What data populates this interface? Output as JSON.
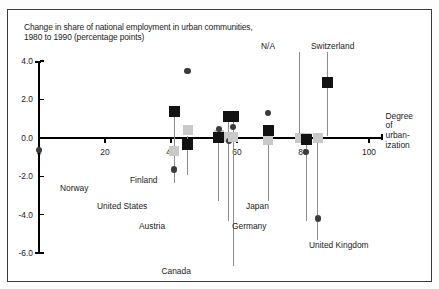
{
  "chart_data": {
    "type": "scatter",
    "title": "Change in share of national employment in urban communities, 1980 to 1990 (percentage points)",
    "title_line1": "Change in share of national employment in urban communities,",
    "title_line2": "1980 to 1990 (percentage points)",
    "xlabel": "Degree of urbanization",
    "xlabel_lines": [
      "Degree",
      "of",
      "urban-",
      "ization"
    ],
    "ylabel": "",
    "xlim": [
      0,
      100
    ],
    "ylim": [
      -6.0,
      4.0
    ],
    "xticks": [
      "0",
      "20",
      "40",
      "60",
      "80",
      "100"
    ],
    "xtick_values": [
      0,
      20,
      40,
      60,
      80,
      100
    ],
    "yticks": [
      "4.0",
      "2.0",
      "0.0",
      "-2.0",
      "-4.0",
      "-6.0"
    ],
    "ytick_values": [
      4.0,
      2.0,
      0.0,
      -2.0,
      -4.0,
      -6.0
    ],
    "grid": false,
    "legend": false,
    "na_note": "N/A",
    "series": [
      {
        "name": "urban (dark square)",
        "color": "#121212",
        "marker": "square"
      },
      {
        "name": "intermediate (light square)",
        "color": "#c9c9c9",
        "marker": "square"
      },
      {
        "name": "rural (dark circle)",
        "color": "#3b3b3b",
        "marker": "circle"
      }
    ],
    "points": [
      {
        "country": "Norway",
        "x": 41.0,
        "dark_square": 1.35,
        "light_square": -0.7,
        "circle": -1.65
      },
      {
        "country": "Finland",
        "x": 45.0,
        "dark_square": -0.35,
        "light_square": 0.4,
        "circle": 3.5
      },
      {
        "country": "United States",
        "x": 54.5,
        "dark_square": 0.0,
        "light_square": 0.15,
        "circle": 0.45
      },
      {
        "country": "Austria",
        "x": 57.5,
        "dark_square": 1.1,
        "light_square": 0.05,
        "circle": -0.15
      },
      {
        "country": "Canada",
        "x": 58.8,
        "dark_square": 1.1,
        "light_square": 0.05,
        "circle": 0.55
      },
      {
        "country": "Japan",
        "x": 69.5,
        "dark_square": 0.4,
        "light_square": -0.1,
        "circle": 1.3
      },
      {
        "country": "N/A",
        "x": 79.0,
        "dark_square": null,
        "light_square": 0.0,
        "circle": null
      },
      {
        "country": "Germany",
        "x": 81.0,
        "dark_square": -0.1,
        "light_square": 0.0,
        "circle": -0.75
      },
      {
        "country": "United Kingdom",
        "x": 84.5,
        "dark_square": null,
        "light_square": 0.0,
        "circle": -4.2
      },
      {
        "country": "Switzerland",
        "x": 87.5,
        "dark_square": 2.9,
        "light_square": null,
        "circle": null
      }
    ]
  },
  "labels": {
    "norway": "Norway",
    "finland": "Finland",
    "united_states": "United States",
    "austria": "Austria",
    "canada": "Canada",
    "japan": "Japan",
    "germany": "Germany",
    "united_kingdom": "United Kingdom",
    "switzerland": "Switzerland",
    "na": "N/A"
  },
  "colors": {
    "dark_marker": "#121212",
    "light_marker": "#c9c9c9",
    "circle_marker": "#3b3b3b",
    "axis": "#000000",
    "frame": "#3a3a3a",
    "text": "#1a1a1a"
  }
}
